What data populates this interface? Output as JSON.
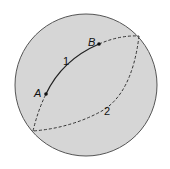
{
  "diagram": {
    "colors": {
      "sphere_fill": "#d6d6d6",
      "sphere_stroke": "#555555",
      "arc_stroke": "#222222",
      "dashed_stroke": "#333333",
      "background": "#ffffff"
    },
    "points": [
      {
        "id": "A",
        "label": "A",
        "x": 46,
        "y": 94
      },
      {
        "id": "B",
        "label": "B",
        "x": 99,
        "y": 44
      }
    ],
    "arcs": [
      {
        "id": "1",
        "label": "1",
        "style": "solid",
        "description": "shorter arc from A to B"
      },
      {
        "id": "2",
        "label": "2",
        "style": "dashed",
        "description": "longer arc around the back"
      }
    ],
    "labels": {
      "point_a": "A",
      "point_b": "B",
      "arc_1": "1",
      "arc_2": "2"
    }
  }
}
